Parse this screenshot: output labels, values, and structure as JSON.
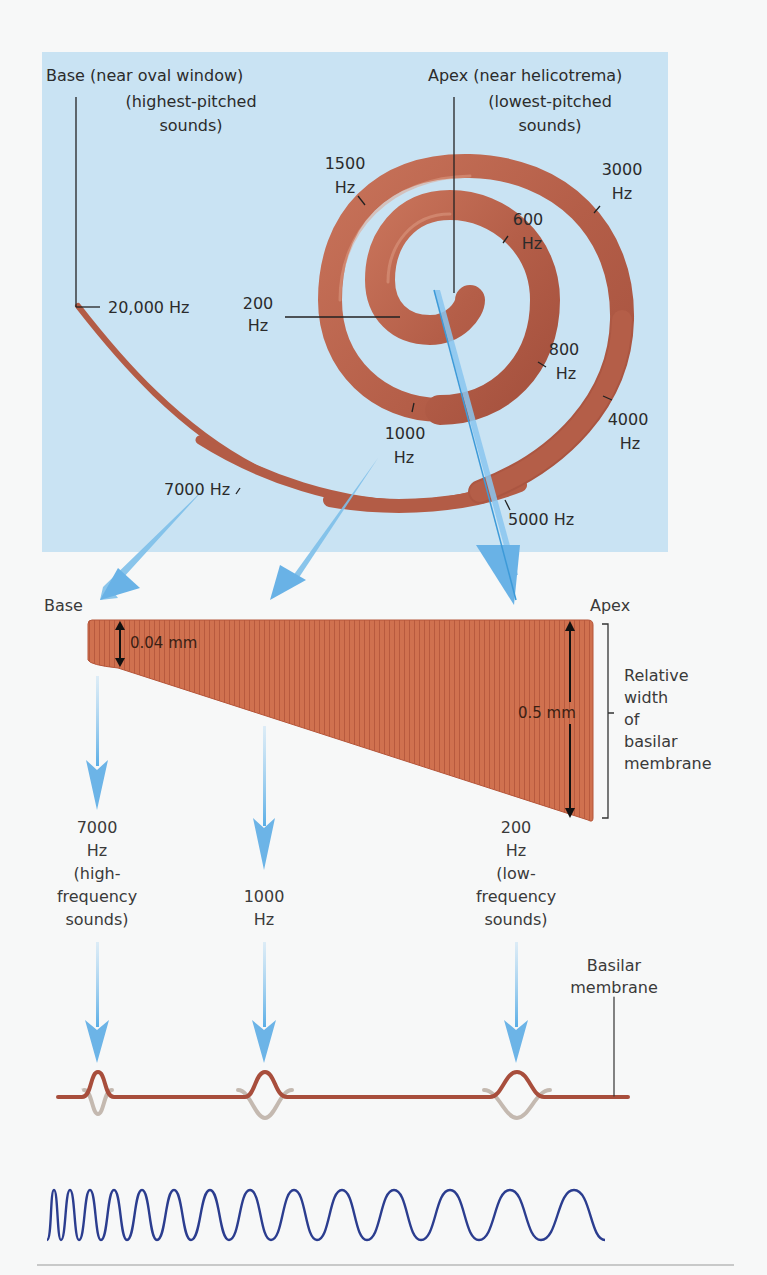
{
  "figure": {
    "colors": {
      "panel_bg": "#c9e3f3",
      "cochlea": "#b8614a",
      "cochlea_highlight": "#d98e72",
      "membrane_fill": "#cf6f52",
      "arrow_blue": "#6fb4e6",
      "wave_blue": "#2b3d8f",
      "membrane_line": "#a84e3c",
      "membrane_ghost": "#bdb3aa",
      "page_bg": "#f7f8f8"
    }
  },
  "spiral_panel": {
    "base_label": "Base (near oval window)",
    "base_sublabel_1": "(highest-pitched",
    "base_sublabel_2": "sounds)",
    "apex_label": "Apex (near helicotrema)",
    "apex_sublabel_1": "(lowest-pitched",
    "apex_sublabel_2": "sounds)",
    "frequency_labels": [
      {
        "value": "20,000 Hz"
      },
      {
        "value": "200",
        "unit": "Hz"
      },
      {
        "value": "1500",
        "unit": "Hz"
      },
      {
        "value": "600",
        "unit": "Hz"
      },
      {
        "value": "3000",
        "unit": "Hz"
      },
      {
        "value": "800",
        "unit": "Hz"
      },
      {
        "value": "4000",
        "unit": "Hz"
      },
      {
        "value": "1000",
        "unit": "Hz"
      },
      {
        "value": "7000 Hz"
      },
      {
        "value": "5000 Hz"
      }
    ]
  },
  "membrane_panel": {
    "base_label": "Base",
    "apex_label": "Apex",
    "base_width": "0.04 mm",
    "apex_width": "0.5 mm",
    "bracket_label_lines": [
      "Relative",
      "width",
      "of",
      "basilar",
      "membrane"
    ]
  },
  "responses": [
    {
      "freq": "7000",
      "unit": "Hz",
      "desc_1": "(high-",
      "desc_2": "frequency",
      "desc_3": "sounds)"
    },
    {
      "freq": "1000",
      "unit": "Hz"
    },
    {
      "freq": "200",
      "unit": "Hz",
      "desc_1": "(low-",
      "desc_2": "frequency",
      "desc_3": "sounds)"
    }
  ],
  "wave_panel": {
    "basilar_label_1": "Basilar",
    "basilar_label_2": "membrane"
  }
}
